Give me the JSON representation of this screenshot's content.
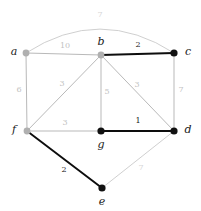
{
  "figure": {
    "background_color": "#ffffff",
    "width": 201,
    "height": 211
  },
  "colors": {
    "highlight_edge": "#0d0d0d",
    "normal_edge": "#b9b9b9",
    "faint_edge": "#c9c9c9",
    "highlight_node": "#111111",
    "normal_node": "#b0b0b0",
    "highlight_weight_text": "#1a1a1a",
    "normal_weight_text": "#c2c2c2",
    "faint_weight_text": "#d6d6d6",
    "node_label_text": "#1a1a1a"
  },
  "chart_data": {
    "type": "diagram",
    "diagram_kind": "weighted-undirected-graph",
    "title": "",
    "nodes": [
      {
        "id": "a",
        "label": "a",
        "x": 26,
        "y": 53,
        "style": "normal",
        "radius": 3.4,
        "label_x": 14,
        "label_y": 52
      },
      {
        "id": "b",
        "label": "b",
        "x": 101,
        "y": 55,
        "style": "normal",
        "radius": 3.4,
        "label_x": 101,
        "label_y": 42
      },
      {
        "id": "c",
        "label": "c",
        "x": 174,
        "y": 53,
        "style": "highlight",
        "radius": 3.6,
        "label_x": 188,
        "label_y": 52
      },
      {
        "id": "f",
        "label": "f",
        "x": 27,
        "y": 131,
        "style": "normal",
        "radius": 3.4,
        "label_x": 14,
        "label_y": 130
      },
      {
        "id": "g",
        "label": "g",
        "x": 101,
        "y": 131,
        "style": "highlight",
        "radius": 3.6,
        "label_x": 101,
        "label_y": 145
      },
      {
        "id": "d",
        "label": "d",
        "x": 174,
        "y": 131,
        "style": "highlight",
        "radius": 3.6,
        "label_x": 188,
        "label_y": 130
      },
      {
        "id": "e",
        "label": "e",
        "x": 102,
        "y": 188,
        "style": "highlight",
        "radius": 3.6,
        "label_x": 102,
        "label_y": 202
      }
    ],
    "edges": [
      {
        "id": "a-c",
        "source": "a",
        "target": "c",
        "weight": 7,
        "style": "faint",
        "curved": true,
        "control_x": 100,
        "control_y": 5,
        "label_x": 100,
        "label_y": 15
      },
      {
        "id": "a-b",
        "source": "a",
        "target": "b",
        "weight": 10,
        "style": "normal",
        "curved": false,
        "label_x": 65,
        "label_y": 46
      },
      {
        "id": "b-c",
        "source": "b",
        "target": "c",
        "weight": 2,
        "style": "highlight",
        "curved": false,
        "label_x": 138,
        "label_y": 45
      },
      {
        "id": "a-f",
        "source": "a",
        "target": "f",
        "weight": 6,
        "style": "normal",
        "curved": false,
        "label_x": 19,
        "label_y": 90
      },
      {
        "id": "f-b",
        "source": "f",
        "target": "b",
        "weight": 3,
        "style": "normal",
        "curved": false,
        "label_x": 62,
        "label_y": 84
      },
      {
        "id": "b-g",
        "source": "b",
        "target": "g",
        "weight": 5,
        "style": "normal",
        "curved": false,
        "label_x": 107,
        "label_y": 92
      },
      {
        "id": "b-d",
        "source": "b",
        "target": "d",
        "weight": 3,
        "style": "normal",
        "curved": false,
        "label_x": 137,
        "label_y": 85
      },
      {
        "id": "c-d",
        "source": "c",
        "target": "d",
        "weight": 7,
        "style": "normal",
        "curved": false,
        "label_x": 181,
        "label_y": 90
      },
      {
        "id": "f-g",
        "source": "f",
        "target": "g",
        "weight": 3,
        "style": "normal",
        "curved": false,
        "label_x": 65,
        "label_y": 123
      },
      {
        "id": "g-d",
        "source": "g",
        "target": "d",
        "weight": 1,
        "style": "highlight",
        "curved": false,
        "label_x": 138,
        "label_y": 121
      },
      {
        "id": "f-e",
        "source": "f",
        "target": "e",
        "weight": 2,
        "style": "highlight",
        "curved": false,
        "label_x": 64,
        "label_y": 170
      },
      {
        "id": "e-d",
        "source": "e",
        "target": "d",
        "weight": 7,
        "style": "faint",
        "curved": false,
        "label_x": 141,
        "label_y": 168
      }
    ]
  }
}
